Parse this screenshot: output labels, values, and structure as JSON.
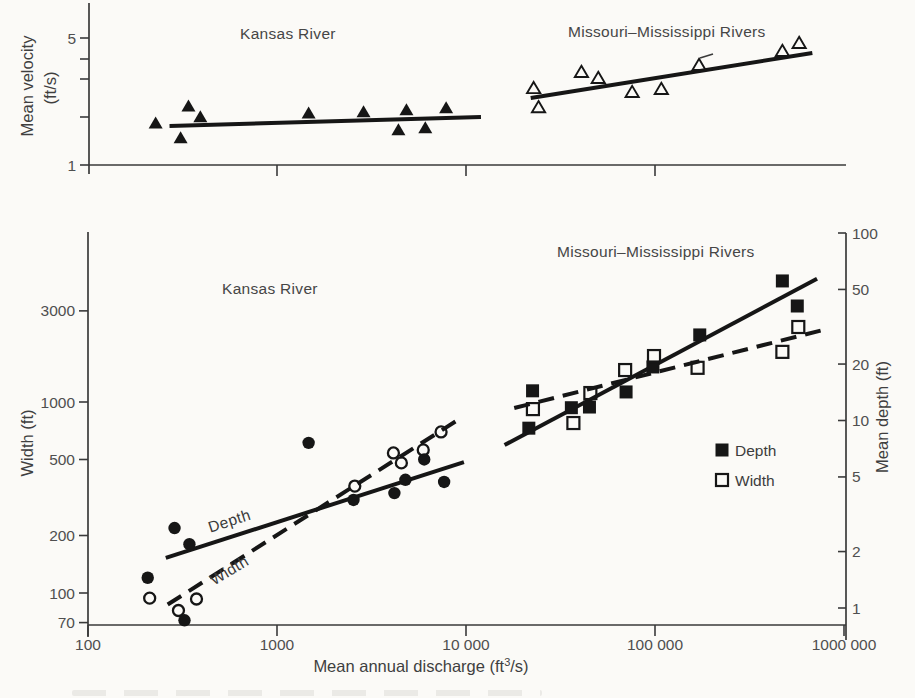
{
  "figure": {
    "paper_color": "#fbfaf7",
    "ink_color": "#161616",
    "axis_color": "#3a3a3a",
    "label_color": "#464646"
  },
  "chart_data": [
    {
      "id": "velocity-panel",
      "type": "scatter",
      "x_axis": {
        "scale": "log",
        "range": [
          100,
          1000000
        ],
        "ticks": [
          {
            "value": 1000,
            "label": ""
          },
          {
            "value": 10000,
            "label": ""
          },
          {
            "value": 100000,
            "label": ""
          }
        ]
      },
      "y_axis": {
        "scale": "log",
        "label_lines": [
          "Mean velocity",
          "(ft/s)"
        ],
        "range": [
          1,
          6
        ],
        "ticks": [
          {
            "value": 5,
            "label": "5"
          },
          {
            "value": 4,
            "label": ""
          },
          {
            "value": 3,
            "label": ""
          },
          {
            "value": 2,
            "label": ""
          },
          {
            "value": 1,
            "label": "1"
          }
        ]
      },
      "annotations": [
        {
          "id": "velocity-kansas-label",
          "text": "Kansas River"
        },
        {
          "id": "velocity-missouri-label",
          "text": "Missouri–Mississippi Rivers"
        }
      ],
      "series": [
        {
          "id": "kansas-velocity",
          "name": "Kansas River",
          "marker": "triangle-filled",
          "points": [
            [
              228,
              1.7
            ],
            [
              309,
              1.41
            ],
            [
              340,
              2.11
            ],
            [
              393,
              1.84
            ],
            [
              1470,
              1.93
            ],
            [
              2870,
              1.96
            ],
            [
              4390,
              1.56
            ],
            [
              4840,
              2.01
            ],
            [
              6090,
              1.6
            ],
            [
              7850,
              2.06
            ]
          ]
        },
        {
          "id": "missouri-velocity",
          "name": "Missouri–Mississippi Rivers",
          "marker": "triangle-open",
          "points": [
            [
              22800,
              2.65
            ],
            [
              24200,
              2.08
            ],
            [
              40800,
              3.25
            ],
            [
              50100,
              3.01
            ],
            [
              75700,
              2.52
            ],
            [
              108000,
              2.62
            ],
            [
              171000,
              3.55
            ],
            [
              472000,
              4.24
            ],
            [
              579000,
              4.69
            ]
          ]
        }
      ],
      "trend_lines": [
        {
          "id": "kansas-velocity-fit",
          "style": "solid",
          "from": [
            270,
            1.64
          ],
          "to": [
            12000,
            1.84
          ]
        },
        {
          "id": "missouri-velocity-fit",
          "style": "solid",
          "from": [
            22000,
            2.34
          ],
          "to": [
            680000,
            4.13
          ]
        }
      ]
    },
    {
      "id": "width-depth-panel",
      "type": "scatter",
      "x_axis": {
        "scale": "log",
        "label": {
          "prefix": "Mean annual discharge  (ft",
          "superscript": "3",
          "suffix": "/s)"
        },
        "range": [
          100,
          1000000
        ],
        "ticks": [
          {
            "value": 100,
            "label": "100"
          },
          {
            "value": 1000,
            "label": "1000"
          },
          {
            "value": 10000,
            "label": "10 000"
          },
          {
            "value": 100000,
            "label": "100 000"
          },
          {
            "value": 1000000,
            "label": "1000 000"
          }
        ]
      },
      "y_axis_left": {
        "scale": "log",
        "label": "Width (ft)",
        "ticks": [
          {
            "value": 3000,
            "label": "3000"
          },
          {
            "value": 1000,
            "label": "1000"
          },
          {
            "value": 500,
            "label": "500"
          },
          {
            "value": 200,
            "label": "200"
          },
          {
            "value": 100,
            "label": "100"
          },
          {
            "value": 70,
            "label": "70"
          }
        ]
      },
      "y_axis_right": {
        "scale": "log",
        "label": "Mean depth (ft)",
        "ticks": [
          {
            "value": 100,
            "label": "100"
          },
          {
            "value": 50,
            "label": "50"
          },
          {
            "value": 20,
            "label": "20"
          },
          {
            "value": 10,
            "label": "10"
          },
          {
            "value": 5,
            "label": "5"
          },
          {
            "value": 2,
            "label": "2"
          },
          {
            "value": 1,
            "label": "1"
          }
        ]
      },
      "annotations": [
        {
          "id": "wd-kansas-label",
          "text": "Kansas River"
        },
        {
          "id": "wd-missouri-label",
          "text": "Missouri–Mississippi Rivers"
        },
        {
          "id": "depth-line-label",
          "text": "Depth"
        },
        {
          "id": "width-line-label",
          "text": "Width"
        }
      ],
      "legend": {
        "items": [
          {
            "marker": "square-filled",
            "label": "Depth"
          },
          {
            "marker": "square-open",
            "label": "Width"
          }
        ]
      },
      "series": [
        {
          "id": "kansas-depth",
          "name": "Kansas River depth",
          "marker": "circle-filled",
          "axis": "right",
          "points": [
            [
              207,
              1.45
            ],
            [
              287,
              2.67
            ],
            [
              324,
              0.86
            ],
            [
              344,
              2.19
            ],
            [
              1470,
              7.6
            ],
            [
              2540,
              3.77
            ],
            [
              4180,
              4.1
            ],
            [
              4780,
              4.83
            ],
            [
              6010,
              6.2
            ],
            [
              7660,
              4.7
            ]
          ]
        },
        {
          "id": "kansas-width",
          "name": "Kansas River width",
          "marker": "circle-open",
          "axis": "left",
          "points": [
            [
              212,
              94
            ],
            [
              301,
              81
            ],
            [
              375,
              93
            ],
            [
              2580,
              363
            ],
            [
              4130,
              541
            ],
            [
              4550,
              480
            ],
            [
              5940,
              561
            ],
            [
              7380,
              697
            ]
          ]
        },
        {
          "id": "missouri-depth",
          "name": "Missouri–Mississippi depth",
          "marker": "square-filled",
          "axis": "right",
          "points": [
            [
              21500,
              9.1
            ],
            [
              22500,
              14.4
            ],
            [
              36100,
              11.7
            ],
            [
              45000,
              11.8
            ],
            [
              70300,
              14.2
            ],
            [
              97500,
              19.3
            ],
            [
              172500,
              28.6
            ],
            [
              472000,
              55.5
            ],
            [
              566000,
              40.8
            ]
          ]
        },
        {
          "id": "missouri-width",
          "name": "Missouri–Mississippi width",
          "marker": "square-open",
          "axis": "left",
          "points": [
            [
              22600,
              918
            ],
            [
              37000,
              776
            ],
            [
              45500,
              1114
            ],
            [
              69500,
              1470
            ],
            [
              98800,
              1740
            ],
            [
              168000,
              1510
            ],
            [
              472000,
              1830
            ],
            [
              573000,
              2470
            ]
          ]
        }
      ],
      "trend_lines": [
        {
          "id": "kansas-depth-fit",
          "style": "solid",
          "axis": "right",
          "from": [
            258,
            1.85
          ],
          "to": [
            9750,
            6.0
          ]
        },
        {
          "id": "kansas-width-fit",
          "style": "dashed",
          "axis": "left",
          "from": [
            264,
            87
          ],
          "to": [
            9400,
            824
          ]
        },
        {
          "id": "missouri-depth-fit",
          "style": "solid",
          "axis": "right",
          "from": [
            16000,
            7.4
          ],
          "to": [
            720000,
            57
          ]
        },
        {
          "id": "missouri-width-fit",
          "style": "dashed",
          "axis": "left",
          "from": [
            18000,
            930
          ],
          "to": [
            770000,
            2380
          ]
        }
      ]
    }
  ]
}
